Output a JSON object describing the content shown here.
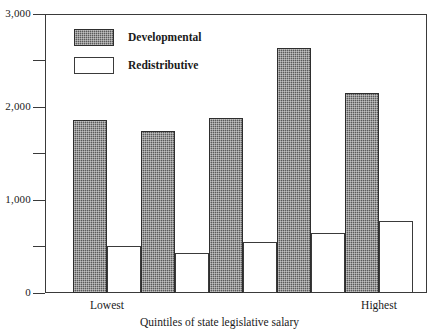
{
  "chart_data": {
    "type": "bar",
    "title": "",
    "xlabel": "Quintiles of state legislative salary",
    "ylabel": "",
    "categories": [
      "Lowest",
      "",
      "",
      "",
      "Highest"
    ],
    "series": [
      {
        "name": "Developmental",
        "values": [
          1860,
          1745,
          1880,
          2640,
          2155
        ]
      },
      {
        "name": "Redistributive",
        "values": [
          510,
          430,
          545,
          645,
          775
        ]
      }
    ],
    "ylim": [
      0,
      3000
    ],
    "yticks": [
      0,
      1000,
      2000,
      3000
    ],
    "ytick_labels": [
      "0",
      "1,000",
      "2,000",
      "3,000"
    ],
    "yticks_minor": [
      500,
      1500,
      2500
    ],
    "grid": false,
    "legend_position": "top-left"
  },
  "axis": {
    "y_label_0": "0",
    "y_label_1000": "1,000",
    "y_label_2000": "2,000",
    "y_label_3000": "3,000",
    "x_title": "Quintiles of state legislative salary",
    "cat_lowest": "Lowest",
    "cat_highest": "Highest"
  },
  "legend": {
    "developmental": "Developmental",
    "redistributive": "Redistributive"
  },
  "colors": {
    "developmental_fill": "#5a5a5a",
    "redistributive_fill": "#ffffff",
    "axis": "#3a3a3a",
    "background": "#ffffff"
  }
}
